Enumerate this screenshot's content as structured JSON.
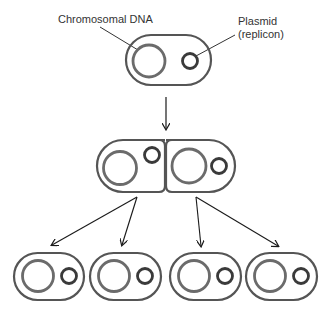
{
  "diagram": {
    "labels": {
      "chromosome": "Chromosomal DNA",
      "plasmid_line1": "Plasmid",
      "plasmid_line2": "(replicon)"
    },
    "colors": {
      "cell_wall": "#555555",
      "chromosome": "#6b6b6b",
      "plasmid": "#3a3a3a",
      "arrow": "#1a1a1a",
      "label_text": "#333333"
    },
    "generations": [
      {
        "stage": "parent",
        "cells": 1
      },
      {
        "stage": "dividing",
        "cells": 2
      },
      {
        "stage": "daughters",
        "cells": 4
      }
    ]
  }
}
